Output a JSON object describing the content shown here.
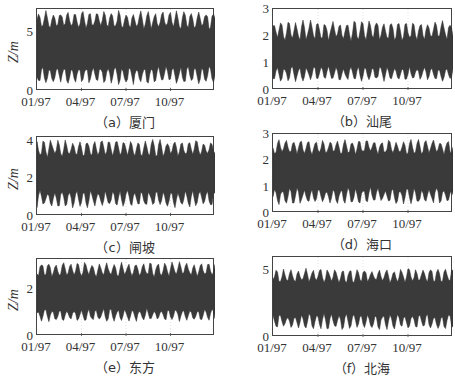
{
  "figure": {
    "ylabel": "Z/m",
    "xtick_labels": [
      "01/97",
      "04/97",
      "07/97",
      "10/97"
    ]
  },
  "panels": [
    {
      "id": "a",
      "caption": "（a）厦门",
      "ylim": [
        0,
        7
      ],
      "yticks": [
        {
          "v": 0,
          "label": "0"
        },
        {
          "v": 5,
          "label": "5"
        }
      ],
      "show_ylabel": true
    },
    {
      "id": "b",
      "caption": "（b）汕尾",
      "ylim": [
        0,
        3
      ],
      "yticks": [
        {
          "v": 0,
          "label": "0"
        },
        {
          "v": 1,
          "label": "1"
        },
        {
          "v": 2,
          "label": "2"
        },
        {
          "v": 3,
          "label": "3"
        }
      ],
      "show_ylabel": false
    },
    {
      "id": "c",
      "caption": "（c）闸坡",
      "ylim": [
        0,
        4.2
      ],
      "yticks": [
        {
          "v": 0,
          "label": "0"
        },
        {
          "v": 2,
          "label": "2"
        },
        {
          "v": 4,
          "label": "4"
        }
      ],
      "show_ylabel": true
    },
    {
      "id": "d",
      "caption": "（d）海口",
      "ylim": [
        0,
        3
      ],
      "yticks": [
        {
          "v": 0,
          "label": "0"
        },
        {
          "v": 1,
          "label": "1"
        },
        {
          "v": 2,
          "label": "2"
        },
        {
          "v": 3,
          "label": "3"
        }
      ],
      "show_ylabel": false
    },
    {
      "id": "e",
      "caption": "（e）东方",
      "ylim": [
        0,
        3.3
      ],
      "yticks": [
        {
          "v": 0,
          "label": "0"
        },
        {
          "v": 2,
          "label": "2"
        }
      ],
      "show_ylabel": true
    },
    {
      "id": "f",
      "caption": "（f）北海",
      "ylim": [
        0,
        6
      ],
      "yticks": [
        {
          "v": 0,
          "label": "0"
        },
        {
          "v": 5,
          "label": "5"
        }
      ],
      "show_ylabel": false
    }
  ],
  "chart_data": [
    {
      "type": "area",
      "title": "（a）厦门",
      "xlabel": "",
      "ylabel": "Z/m",
      "x_ticks": [
        "01/97",
        "04/97",
        "07/97",
        "10/97"
      ],
      "ylim": [
        0,
        7
      ],
      "grid": true,
      "series": [
        {
          "name": "water level envelope",
          "mean": 3.6,
          "high_range": [
            5.2,
            6.9
          ],
          "low_range": [
            0.5,
            2.2
          ]
        }
      ]
    },
    {
      "type": "area",
      "title": "（b）汕尾",
      "xlabel": "",
      "ylabel": "",
      "x_ticks": [
        "01/97",
        "04/97",
        "07/97",
        "10/97"
      ],
      "ylim": [
        0,
        3
      ],
      "grid": true,
      "series": [
        {
          "name": "water level envelope",
          "mean": 1.4,
          "high_range": [
            1.8,
            2.6
          ],
          "low_range": [
            0.3,
            0.9
          ]
        }
      ]
    },
    {
      "type": "area",
      "title": "（c）闸坡",
      "xlabel": "",
      "ylabel": "Z/m",
      "x_ticks": [
        "01/97",
        "04/97",
        "07/97",
        "10/97"
      ],
      "ylim": [
        0,
        4.2
      ],
      "grid": true,
      "series": [
        {
          "name": "water level envelope",
          "mean": 2.2,
          "high_range": [
            3.1,
            4.1
          ],
          "low_range": [
            0.4,
            1.4
          ]
        }
      ]
    },
    {
      "type": "area",
      "title": "（d）海口",
      "xlabel": "",
      "ylabel": "",
      "x_ticks": [
        "01/97",
        "04/97",
        "07/97",
        "10/97"
      ],
      "ylim": [
        0,
        3
      ],
      "grid": true,
      "series": [
        {
          "name": "water level envelope",
          "mean": 1.6,
          "high_range": [
            2.2,
            2.8
          ],
          "low_range": [
            0.3,
            1.0
          ]
        }
      ]
    },
    {
      "type": "area",
      "title": "（e）东方",
      "xlabel": "",
      "ylabel": "Z/m",
      "x_ticks": [
        "01/97",
        "04/97",
        "07/97",
        "10/97"
      ],
      "ylim": [
        0,
        3.3
      ],
      "grid": true,
      "series": [
        {
          "name": "water level envelope",
          "mean": 1.8,
          "high_range": [
            2.5,
            3.2
          ],
          "low_range": [
            0.6,
            1.2
          ]
        }
      ]
    },
    {
      "type": "area",
      "title": "（f）北海",
      "xlabel": "",
      "ylabel": "",
      "x_ticks": [
        "01/97",
        "04/97",
        "07/97",
        "10/97"
      ],
      "ylim": [
        0,
        6
      ],
      "grid": true,
      "series": [
        {
          "name": "water level envelope",
          "mean": 2.8,
          "high_range": [
            4.0,
            5.2
          ],
          "low_range": [
            0.5,
            1.8
          ]
        }
      ]
    }
  ]
}
